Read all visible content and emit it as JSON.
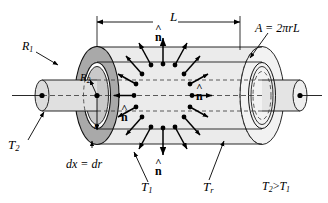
{
  "figure": {
    "background_color": "#ffffff",
    "line_color": "#000000",
    "shade_outer_disc": "#a8a8a8",
    "shade_body": "#e8e8e8",
    "shade_inner": "#d0d0d0"
  },
  "dimensions": {
    "length_label": "L",
    "area_label": "A = 2πrL",
    "thickness_label": "dx = dr",
    "outer_radius_label": "R",
    "outer_radius_sub": "1",
    "inner_radius_label": "R",
    "inner_radius_sub": "2",
    "radius_label": "r"
  },
  "temperatures": {
    "inner_label": "T",
    "inner_sub": "2",
    "outer_label": "T",
    "outer_sub": "1",
    "surface_label": "T",
    "surface_sub": "r",
    "inequality_left": "T",
    "inequality_left_sub": "2",
    "inequality_op": ">",
    "inequality_right": "T",
    "inequality_right_sub": "1",
    "inequality_full": "T2 > T1"
  },
  "normals": {
    "glyph_hat": "˄",
    "glyph_base": "n",
    "name": "unit-normal-vector",
    "count": 4,
    "positions": [
      "top",
      "bottom",
      "left-interior",
      "right-interior"
    ]
  },
  "icons": {
    "axis_dot": "axis-center-dot",
    "arrow_head": "arrowhead",
    "leader": "leader-line"
  }
}
